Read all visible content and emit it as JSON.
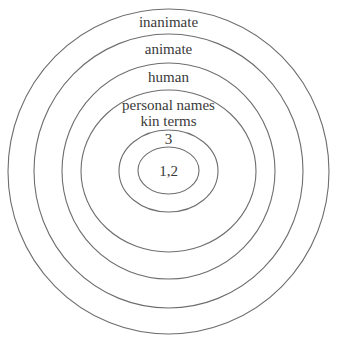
{
  "diagram": {
    "type": "nested-ellipses",
    "stroke_color": "#6e6e6e",
    "text_color": "#3a3a3a",
    "rings": [
      {
        "label": "inanimate",
        "cx": 168.5,
        "cy": 171.5,
        "rx": 160.5,
        "ry": 162.5,
        "label_y": 27
      },
      {
        "label": "animate",
        "cx": 168.5,
        "cy": 171,
        "rx": 134.5,
        "ry": 137,
        "label_y": 54
      },
      {
        "label": "human",
        "cx": 168.5,
        "cy": 171,
        "rx": 106.5,
        "ry": 108,
        "label_y": 82
      },
      {
        "label": "personal names",
        "label2": "kin terms",
        "cx": 168.5,
        "cy": 171,
        "rx": 87.5,
        "ry": 81,
        "label_y": 110,
        "label2_y": 126
      },
      {
        "label": "3",
        "cx": 168.5,
        "cy": 171,
        "rx": 49.5,
        "ry": 41,
        "label_y": 144
      },
      {
        "label": "1,2",
        "cx": 168.5,
        "cy": 170.5,
        "rx": 30.5,
        "ry": 23.5,
        "label_y": 176
      }
    ]
  }
}
